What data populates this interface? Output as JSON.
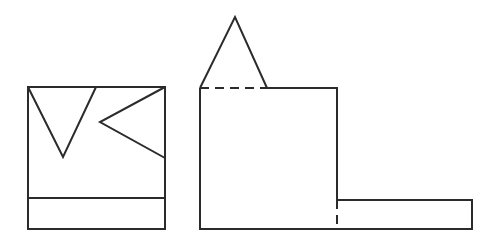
{
  "diagram": {
    "stroke_color": "#2b2b2b",
    "background": "#ffffff",
    "left_view": {
      "outer_rect": {
        "x": 28,
        "y": 87,
        "w": 137,
        "h": 142
      },
      "divider_y": 198,
      "triangle_down": [
        [
          28,
          87
        ],
        [
          96,
          87
        ],
        [
          63,
          157
        ]
      ],
      "triangle_left": [
        [
          165,
          87
        ],
        [
          100,
          122
        ],
        [
          165,
          158
        ]
      ]
    },
    "right_view": {
      "triangle_top": [
        [
          200,
          88
        ],
        [
          235,
          17
        ],
        [
          267,
          88
        ]
      ],
      "dashed_top_edge": [
        [
          200,
          88
        ],
        [
          267,
          88
        ]
      ],
      "solid_top_edge": [
        [
          267,
          88
        ],
        [
          337,
          88
        ]
      ],
      "main_rect": {
        "x": 200,
        "y": 88,
        "w": 137,
        "h": 141
      },
      "strip": {
        "x": 337,
        "y": 200,
        "w": 135,
        "h": 29
      },
      "dashed_vertical": [
        [
          337,
          200
        ],
        [
          337,
          229
        ]
      ]
    }
  }
}
